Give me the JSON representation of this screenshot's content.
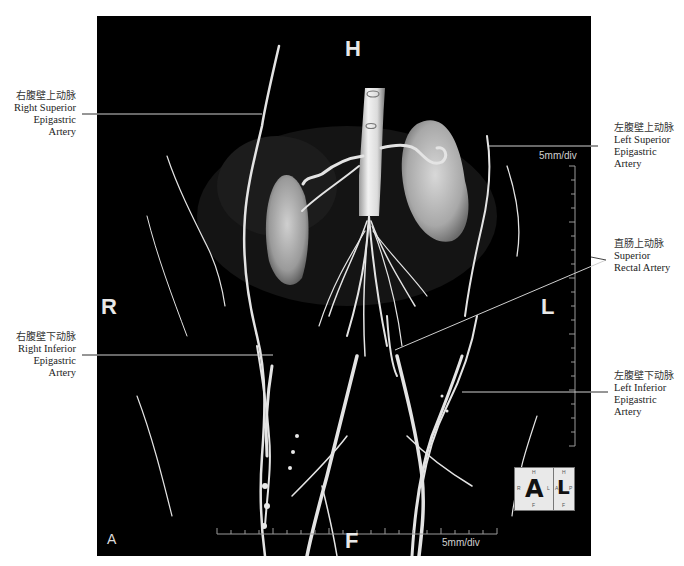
{
  "figure": {
    "panel_letter": "A",
    "orientation": {
      "top": "H",
      "bottom": "F",
      "left": "R",
      "right": "L"
    },
    "scale_bars": {
      "vertical": "5mm/div",
      "horizontal": "5mm/div"
    },
    "orientation_cube": {
      "front_face": "A",
      "side_face": "L",
      "front_small": {
        "top": "H",
        "left": "R",
        "right": "L",
        "bottom": "F"
      },
      "side_small": {
        "top": "H",
        "left": "A",
        "right": "P",
        "bottom": "F"
      }
    },
    "colors": {
      "background": "#000000",
      "vessel": "#e6e6e6",
      "leader_line": "#cccccc",
      "label_text": "#222222"
    }
  },
  "annotations": [
    {
      "id": "right-superior-epigastric-artery",
      "zh": "右腹壁上动脉",
      "en_lines": [
        "Right Superior",
        "Epigastric",
        "Artery"
      ],
      "side": "left"
    },
    {
      "id": "left-superior-epigastric-artery",
      "zh": "左腹壁上动脉",
      "en_lines": [
        "Left Superior",
        "Epigastric",
        "Artery"
      ],
      "side": "right"
    },
    {
      "id": "superior-rectal-artery",
      "zh": "直肠上动脉",
      "en_lines": [
        "Superior",
        "Rectal Artery"
      ],
      "side": "right"
    },
    {
      "id": "right-inferior-epigastric-artery",
      "zh": "右腹壁下动脉",
      "en_lines": [
        "Right Inferior",
        "Epigastric",
        "Artery"
      ],
      "side": "left"
    },
    {
      "id": "left-inferior-epigastric-artery",
      "zh": "左腹壁下动脉",
      "en_lines": [
        "Left Inferior",
        "Epigastric",
        "Artery"
      ],
      "side": "right"
    }
  ]
}
